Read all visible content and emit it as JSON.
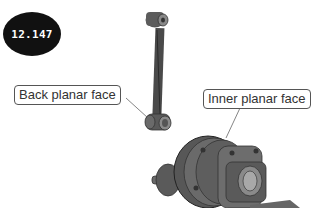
{
  "figure": {
    "badge_number": "12.147",
    "callouts": [
      {
        "label": "Back planar face"
      },
      {
        "label": "Inner planar face"
      }
    ],
    "parts": [
      "connecting-link",
      "pump-housing-assembly"
    ]
  }
}
